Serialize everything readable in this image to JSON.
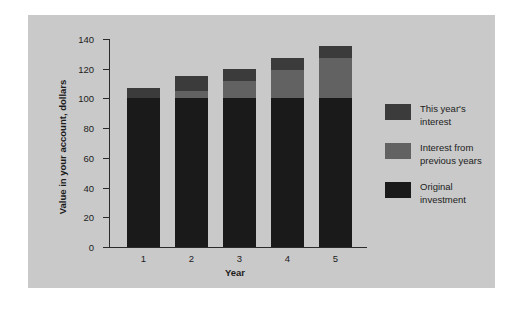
{
  "chart_data": {
    "type": "bar",
    "subtype": "stacked",
    "title": "",
    "xlabel": "Year",
    "ylabel": "Value in your account, dollars",
    "categories": [
      "1",
      "2",
      "3",
      "4",
      "5"
    ],
    "ylim": [
      0,
      140
    ],
    "yticks": [
      0,
      20,
      40,
      60,
      80,
      100,
      120,
      140
    ],
    "grid": false,
    "legend_position": "right",
    "series": [
      {
        "name": "Original investment",
        "color": "#1a1a1a",
        "values": [
          100,
          100,
          100,
          100,
          100
        ]
      },
      {
        "name": "Interest from previous years",
        "color": "#626262",
        "values": [
          0,
          5,
          12,
          19,
          27
        ]
      },
      {
        "name": "This year's interest",
        "color": "#3b3b3b",
        "values": [
          7,
          10,
          8,
          8,
          8
        ]
      }
    ],
    "totals": [
      107,
      115,
      120,
      127,
      135
    ]
  },
  "axes": {
    "y_tick_labels": [
      "0",
      "20",
      "40",
      "60",
      "80",
      "100",
      "120",
      "140"
    ],
    "x_tick_labels": [
      "1",
      "2",
      "3",
      "4",
      "5"
    ],
    "y_axis_title": "Value in your account, dollars",
    "x_axis_title": "Year"
  },
  "legend": {
    "items": [
      {
        "label_line1": "This year's",
        "label_line2": "interest",
        "color": "#3b3b3b"
      },
      {
        "label_line1": "Interest from",
        "label_line2": "previous years",
        "color": "#626262"
      },
      {
        "label_line1": "Original",
        "label_line2": "investment",
        "color": "#1a1a1a"
      }
    ]
  },
  "colors": {
    "panel_background": "#c9c9c9",
    "figure_background": "#ffffff",
    "axis": "#2b2b2b",
    "text": "#1c1c1c"
  }
}
